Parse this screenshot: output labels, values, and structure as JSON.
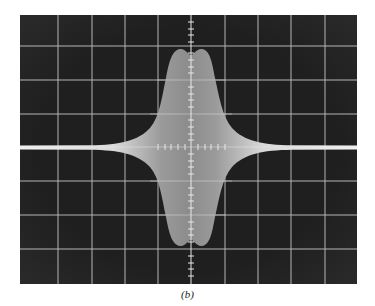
{
  "figure": {
    "caption": "(b)",
    "type": "oscilloscope-photograph",
    "screen": {
      "background": "#1c1c1c",
      "grid_color": "#d8d8d8",
      "trace_color": "#e6e6e6",
      "x_divisions": 10,
      "y_divisions": 8,
      "minor_ticks_per_division": 5
    },
    "trace": {
      "description": "Symmetric burst envelope: thin horizontal baseline that swells into a wide double-humped pulse centered on screen",
      "envelope_peak_divisions": 3.0,
      "baseline_halfwidth_divisions": 0.05,
      "pulse_width_divisions": 1.1
    }
  }
}
